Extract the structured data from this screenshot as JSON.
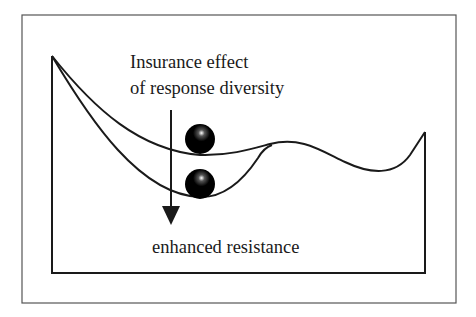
{
  "diagram": {
    "labels": {
      "line1": "Insurance effect",
      "line2": "of response diversity",
      "bottom": "enhanced resistance"
    },
    "elements": {
      "upper_landscape": "stability landscape with shallow basin",
      "lower_landscape": "stability landscape with deeper basin",
      "upper_ball": "system state (low diversity)",
      "lower_ball": "system state (high response diversity)",
      "arrow": "downward arrow indicating deepening basin"
    },
    "colors": {
      "line": "#1a1a1a",
      "background": "#ffffff",
      "frame": "#555555"
    }
  }
}
